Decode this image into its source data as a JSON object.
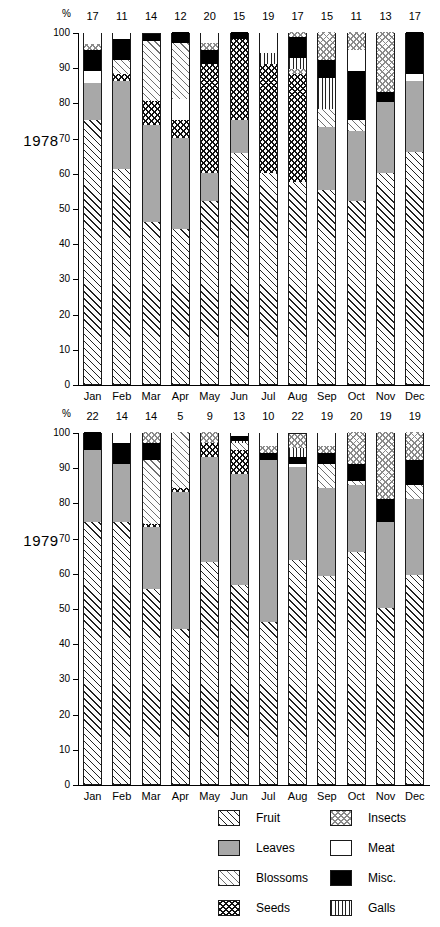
{
  "axis": {
    "unit_label": "%",
    "ticks": [
      0,
      10,
      20,
      30,
      40,
      50,
      60,
      70,
      80,
      90,
      100
    ],
    "months": [
      "Jan",
      "Feb",
      "Mar",
      "Apr",
      "May",
      "Jun",
      "Jul",
      "Aug",
      "Sep",
      "Oct",
      "Nov",
      "Dec"
    ]
  },
  "panels": [
    {
      "year_label": "1978"
    },
    {
      "year_label": "1979"
    }
  ],
  "legend": {
    "items": [
      {
        "label": "Fruit",
        "key": "fruit"
      },
      {
        "label": "Leaves",
        "key": "leaves"
      },
      {
        "label": "Blossoms",
        "key": "blossoms"
      },
      {
        "label": "Seeds",
        "key": "seeds"
      },
      {
        "label": "Insects",
        "key": "insects"
      },
      {
        "label": "Meat",
        "key": "meat"
      },
      {
        "label": "Misc.",
        "key": "misc"
      },
      {
        "label": "Galls",
        "key": "galls"
      }
    ]
  },
  "chart_data": [
    {
      "type": "bar",
      "title": "1978",
      "subtitle": "Stacked percentage composition of diet by month",
      "xlabel": "",
      "ylabel": "%",
      "ylim": [
        0,
        100
      ],
      "grid": false,
      "stacked": true,
      "legend_position": "bottom",
      "categories": [
        "Jan",
        "Feb",
        "Mar",
        "Apr",
        "May",
        "Jun",
        "Jul",
        "Aug",
        "Sep",
        "Oct",
        "Nov",
        "Dec"
      ],
      "sample_sizes": [
        17,
        11,
        14,
        12,
        20,
        15,
        19,
        17,
        15,
        11,
        13,
        17
      ],
      "series": [
        {
          "name": "Fruit",
          "values": [
            75,
            61,
            46,
            44,
            52,
            65.5,
            60,
            57.5,
            55,
            52,
            60,
            66
          ]
        },
        {
          "name": "Leaves",
          "values": [
            10.5,
            25,
            27.5,
            26,
            8,
            9.5,
            0,
            0,
            18,
            20,
            20,
            20
          ]
        },
        {
          "name": "Blossoms",
          "values": [
            0,
            4,
            17,
            16,
            0,
            0,
            0,
            0,
            5,
            3,
            0,
            0
          ]
        },
        {
          "name": "Seeds",
          "values": [
            0,
            2,
            7,
            5,
            31,
            23,
            31,
            30.5,
            0,
            0,
            0,
            0
          ]
        },
        {
          "name": "Insects",
          "values": [
            1.5,
            0,
            0,
            0,
            2,
            0,
            0,
            3,
            8,
            5,
            17,
            0
          ]
        },
        {
          "name": "Meat",
          "values": [
            7,
            2,
            0,
            6,
            3,
            0,
            6,
            0,
            0,
            6,
            0,
            2
          ]
        },
        {
          "name": "Misc.",
          "values": [
            6,
            6,
            2,
            3,
            4,
            2,
            0,
            6,
            5,
            14,
            3,
            12
          ]
        },
        {
          "name": "Galls",
          "values": [
            0,
            0,
            0,
            0,
            0,
            0,
            3,
            3,
            9,
            0,
            0,
            0
          ]
        }
      ]
    },
    {
      "type": "bar",
      "title": "1979",
      "subtitle": "Stacked percentage composition of diet by month",
      "xlabel": "",
      "ylabel": "%",
      "ylim": [
        0,
        100
      ],
      "grid": false,
      "stacked": true,
      "legend_position": "bottom",
      "categories": [
        "Jan",
        "Feb",
        "Mar",
        "Apr",
        "May",
        "Jun",
        "Jul",
        "Aug",
        "Sep",
        "Oct",
        "Nov",
        "Dec"
      ],
      "sample_sizes": [
        22,
        14,
        14,
        5,
        9,
        13,
        10,
        22,
        19,
        20,
        19,
        19
      ],
      "series": [
        {
          "name": "Fruit",
          "values": [
            74.5,
            74.5,
            55.5,
            44,
            63,
            56.5,
            46,
            63.5,
            59,
            66,
            50,
            59.5
          ]
        },
        {
          "name": "Leaves",
          "values": [
            20.5,
            16.5,
            17.5,
            39,
            30,
            31.5,
            46,
            26.5,
            25,
            19,
            24.5,
            21.5
          ]
        },
        {
          "name": "Blossoms",
          "values": [
            0,
            0,
            18,
            16,
            0,
            2,
            0,
            0,
            7,
            1,
            0,
            4
          ]
        },
        {
          "name": "Seeds",
          "values": [
            0,
            0,
            1,
            1,
            4,
            7,
            0,
            0,
            0,
            0,
            0,
            0
          ]
        },
        {
          "name": "Insects",
          "values": [
            0,
            0,
            3,
            0,
            3,
            0,
            2,
            4,
            2,
            9,
            19,
            8
          ]
        },
        {
          "name": "Meat",
          "values": [
            0,
            3,
            0,
            0,
            0,
            1,
            4,
            1,
            4,
            0,
            0,
            0
          ]
        },
        {
          "name": "Misc.",
          "values": [
            5,
            6,
            5,
            0,
            0,
            1.5,
            2,
            2,
            3,
            5,
            6.5,
            7
          ]
        },
        {
          "name": "Galls",
          "values": [
            0,
            0,
            0,
            0,
            0,
            0.5,
            0,
            2.5,
            0,
            0,
            0,
            0
          ]
        }
      ]
    }
  ]
}
